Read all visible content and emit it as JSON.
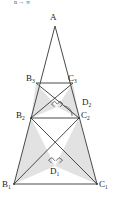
{
  "figure": {
    "top_note": "n → ∞",
    "colors": {
      "stroke": "#4a4a4a",
      "shade": "#e2e2e2",
      "label": "#1a1a1a"
    },
    "labels": {
      "apex": "A",
      "b3": "B",
      "b3_sub": "3",
      "c3": "C",
      "c3_sub": "3",
      "d2": "D",
      "d2_sub": "2",
      "b2": "B",
      "b2_sub": "2",
      "c2": "C",
      "c2_sub": "2",
      "d1": "D",
      "d1_sub": "1",
      "b1": "B",
      "b1_sub": "1",
      "c1": "C",
      "c1_sub": "1"
    },
    "points": {
      "A": [
        55,
        26
      ],
      "B3": [
        36,
        83
      ],
      "C3": [
        73,
        83
      ],
      "D2": [
        57,
        107
      ],
      "B2": [
        31,
        118
      ],
      "C2": [
        79,
        118
      ],
      "D1": [
        55,
        166
      ],
      "B1": [
        14,
        184
      ],
      "C1": [
        97,
        184
      ]
    },
    "shaded_regions": [
      {
        "name": "upper-left-shade",
        "pts": "36,83 57,107 31,118"
      },
      {
        "name": "upper-right-shade",
        "pts": "73,83 57,107 79,118"
      },
      {
        "name": "lower-left-shade",
        "pts": "31,118 55,166 14,184"
      },
      {
        "name": "lower-right-shade",
        "pts": "79,118 55,166 97,184"
      }
    ],
    "right_angle_marks": [
      {
        "name": "right-angle-d2-left"
      },
      {
        "name": "right-angle-d2-right"
      },
      {
        "name": "right-angle-d1-left"
      },
      {
        "name": "right-angle-d1-right"
      }
    ],
    "arc_marks": [
      {
        "name": "angle-arc-d2-c2"
      }
    ]
  }
}
